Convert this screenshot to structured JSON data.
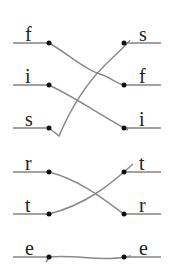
{
  "diagram": {
    "left_labels": [
      "f",
      "i",
      "s",
      "r",
      "t",
      "e"
    ],
    "right_labels": [
      "s",
      "f",
      "i",
      "t",
      "r",
      "e"
    ],
    "line_color": "#444444",
    "connector_color": "#8a8a8a",
    "rows_y": [
      43,
      85,
      128,
      172,
      214,
      257
    ]
  }
}
